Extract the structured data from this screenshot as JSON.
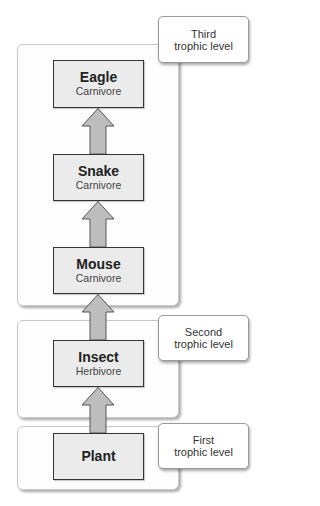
{
  "diagram": {
    "type": "food-chain-trophic-levels",
    "colors": {
      "organism_fill": "#ebebeb",
      "organism_border": "#333333",
      "arrow_fill": "#bdbdbd",
      "arrow_border": "#555555",
      "container_fill": "#fdfdfd",
      "container_border": "#c8c8c8"
    },
    "levels": [
      {
        "id": "third",
        "label": "Third\ntrophic level",
        "organisms": [
          "eagle",
          "snake",
          "mouse"
        ]
      },
      {
        "id": "second",
        "label": "Second\ntrophic level",
        "organisms": [
          "insect"
        ]
      },
      {
        "id": "first",
        "label": "First\ntrophic level",
        "organisms": [
          "plant"
        ]
      }
    ],
    "organisms": {
      "eagle": {
        "name": "Eagle",
        "role": "Carnivore"
      },
      "snake": {
        "name": "Snake",
        "role": "Carnivore"
      },
      "mouse": {
        "name": "Mouse",
        "role": "Carnivore"
      },
      "insect": {
        "name": "Insect",
        "role": "Herbivore"
      },
      "plant": {
        "name": "Plant",
        "role": ""
      }
    },
    "arrows": [
      {
        "from": "snake",
        "to": "eagle"
      },
      {
        "from": "mouse",
        "to": "snake"
      },
      {
        "from": "insect",
        "to": "mouse"
      },
      {
        "from": "plant",
        "to": "insect"
      }
    ]
  }
}
